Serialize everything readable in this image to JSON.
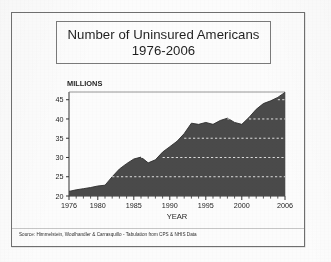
{
  "slide": {
    "title_line1": "Number of Uninsured Americans",
    "title_line2": "1976-2006",
    "source_note": "Source: Himmelstein, Woolhandler & Carrasquillo - Tabulation from CPS & NHIS Data",
    "border_color": "#6f6f6f",
    "paper_color": "#fcfcfc"
  },
  "chart_data": {
    "type": "area",
    "title": "Number of Uninsured Americans 1976-2006",
    "xlabel": "YEAR",
    "ylabel": "MILLIONS",
    "ylabel_position": "above-axis-left",
    "xlim": [
      1976,
      2006
    ],
    "ylim": [
      20,
      47
    ],
    "y_ticks": [
      20,
      25,
      30,
      35,
      40,
      45
    ],
    "y_tick_labels": [
      "20",
      "25",
      "30",
      "35",
      "40",
      "45"
    ],
    "x_ticks": [
      1976,
      1980,
      1985,
      1990,
      1995,
      2000,
      2006
    ],
    "x_tick_labels": [
      "1976",
      "1980",
      "1985",
      "1990",
      "1995",
      "2000",
      "2006"
    ],
    "x_minor_tick_interval": 1,
    "grid": true,
    "grid_style": "dashed-white-horizontal",
    "grid_values": [
      25,
      30,
      35,
      40,
      45
    ],
    "legend": null,
    "legend_position": "none",
    "fill_color": "#4a4a4a",
    "line_color": "#2e2e2e",
    "axis_color": "#333333",
    "units": "millions of people",
    "x": [
      1976,
      1977,
      1978,
      1979,
      1980,
      1981,
      1982,
      1983,
      1984,
      1985,
      1986,
      1987,
      1988,
      1989,
      1990,
      1991,
      1992,
      1993,
      1994,
      1995,
      1996,
      1997,
      1998,
      1999,
      2000,
      2001,
      2002,
      2003,
      2004,
      2005,
      2006
    ],
    "values": [
      21.2,
      21.6,
      21.9,
      22.2,
      22.6,
      22.8,
      25.0,
      27.0,
      28.4,
      29.6,
      30.1,
      28.6,
      29.4,
      31.4,
      32.8,
      34.2,
      36.2,
      38.9,
      38.6,
      39.1,
      38.6,
      39.6,
      40.2,
      39.1,
      38.6,
      40.4,
      42.5,
      44.0,
      44.7,
      45.6,
      46.9
    ],
    "annotations": [
      {
        "text": "MILLIONS",
        "type": "axis-unit-label"
      },
      {
        "text": "YEAR",
        "type": "axis-title"
      }
    ]
  }
}
